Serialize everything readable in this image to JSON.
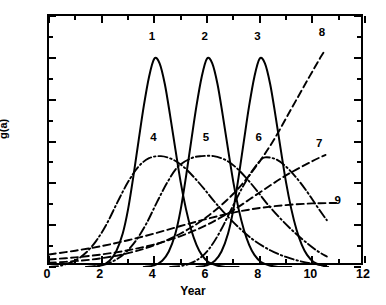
{
  "chart_data": {
    "type": "line",
    "title": "",
    "xlabel": "Year",
    "ylabel": "g(a)",
    "xlim": [
      0,
      12
    ],
    "ylim": [
      0.0,
      0.6
    ],
    "grid": false,
    "legend_position": "inline-annotations",
    "x_ticks": [
      "0",
      "2",
      "4",
      "6",
      "8",
      "10",
      "12"
    ],
    "x_tick_values": [
      0,
      2,
      4,
      6,
      8,
      10,
      12
    ],
    "x_minor_tick_values": [
      1,
      3,
      5,
      7,
      9,
      11
    ],
    "y_ticks": [
      "0.0",
      "0.1",
      "0.2",
      "0.3",
      "0.4",
      "0.5",
      "0.6"
    ],
    "y_tick_values": [
      0.0,
      0.1,
      0.2,
      0.3,
      0.4,
      0.5,
      0.6
    ],
    "y_minor_tick_values": [
      0.05,
      0.15,
      0.25,
      0.35,
      0.45,
      0.55
    ],
    "series": [
      {
        "name": "1",
        "label": "1",
        "style": "solid",
        "label_x": 4.0,
        "label_y": 0.545,
        "peak_x": 4.0,
        "peak_y": 0.5,
        "points": [
          [
            1.6,
            0.0
          ],
          [
            2.0,
            0.004
          ],
          [
            2.3,
            0.015
          ],
          [
            2.55,
            0.037
          ],
          [
            2.8,
            0.08
          ],
          [
            3.0,
            0.137
          ],
          [
            3.2,
            0.215
          ],
          [
            3.4,
            0.301
          ],
          [
            3.6,
            0.385
          ],
          [
            3.8,
            0.455
          ],
          [
            4.0,
            0.498
          ],
          [
            4.2,
            0.487
          ],
          [
            4.4,
            0.437
          ],
          [
            4.6,
            0.362
          ],
          [
            4.8,
            0.281
          ],
          [
            5.0,
            0.203
          ],
          [
            5.2,
            0.139
          ],
          [
            5.4,
            0.089
          ],
          [
            5.6,
            0.053
          ],
          [
            5.8,
            0.029
          ],
          [
            6.05,
            0.012
          ],
          [
            6.35,
            0.004
          ],
          [
            6.7,
            0.0
          ],
          [
            7.2,
            0.0
          ]
        ]
      },
      {
        "name": "2",
        "label": "2",
        "style": "solid",
        "label_x": 6.0,
        "label_y": 0.545,
        "peak_x": 6.0,
        "peak_y": 0.5,
        "points": [
          [
            3.6,
            0.0
          ],
          [
            4.0,
            0.004
          ],
          [
            4.3,
            0.015
          ],
          [
            4.55,
            0.037
          ],
          [
            4.8,
            0.08
          ],
          [
            5.0,
            0.137
          ],
          [
            5.2,
            0.215
          ],
          [
            5.4,
            0.301
          ],
          [
            5.6,
            0.385
          ],
          [
            5.8,
            0.455
          ],
          [
            6.0,
            0.498
          ],
          [
            6.2,
            0.487
          ],
          [
            6.4,
            0.437
          ],
          [
            6.6,
            0.362
          ],
          [
            6.8,
            0.281
          ],
          [
            7.0,
            0.203
          ],
          [
            7.2,
            0.139
          ],
          [
            7.4,
            0.089
          ],
          [
            7.6,
            0.053
          ],
          [
            7.8,
            0.029
          ],
          [
            8.05,
            0.012
          ],
          [
            8.35,
            0.004
          ],
          [
            8.7,
            0.0
          ],
          [
            9.2,
            0.0
          ]
        ]
      },
      {
        "name": "3",
        "label": "3",
        "style": "solid",
        "label_x": 8.0,
        "label_y": 0.545,
        "peak_x": 8.0,
        "peak_y": 0.5,
        "points": [
          [
            5.6,
            0.0
          ],
          [
            6.0,
            0.004
          ],
          [
            6.3,
            0.015
          ],
          [
            6.55,
            0.037
          ],
          [
            6.8,
            0.08
          ],
          [
            7.0,
            0.137
          ],
          [
            7.2,
            0.215
          ],
          [
            7.4,
            0.301
          ],
          [
            7.6,
            0.385
          ],
          [
            7.8,
            0.455
          ],
          [
            8.0,
            0.498
          ],
          [
            8.2,
            0.487
          ],
          [
            8.4,
            0.437
          ],
          [
            8.6,
            0.362
          ],
          [
            8.8,
            0.281
          ],
          [
            9.0,
            0.203
          ],
          [
            9.2,
            0.139
          ],
          [
            9.4,
            0.089
          ],
          [
            9.6,
            0.053
          ],
          [
            9.8,
            0.029
          ],
          [
            10.05,
            0.012
          ],
          [
            10.35,
            0.004
          ],
          [
            10.6,
            0.0
          ]
        ]
      },
      {
        "name": "4",
        "label": "4",
        "style": "dash-dot",
        "label_x": 4.05,
        "label_y": 0.303,
        "peak_x": 4.25,
        "peak_y": 0.265,
        "points": [
          [
            0.0,
            0.0
          ],
          [
            0.5,
            0.004
          ],
          [
            1.0,
            0.016
          ],
          [
            1.4,
            0.034
          ],
          [
            1.8,
            0.063
          ],
          [
            2.2,
            0.104
          ],
          [
            2.6,
            0.155
          ],
          [
            3.0,
            0.203
          ],
          [
            3.4,
            0.24
          ],
          [
            3.8,
            0.26
          ],
          [
            4.25,
            0.265
          ],
          [
            4.7,
            0.257
          ],
          [
            5.1,
            0.24
          ],
          [
            5.5,
            0.215
          ],
          [
            5.9,
            0.186
          ],
          [
            6.3,
            0.155
          ],
          [
            6.8,
            0.12
          ],
          [
            7.3,
            0.089
          ],
          [
            7.8,
            0.063
          ],
          [
            8.4,
            0.04
          ],
          [
            9.0,
            0.024
          ],
          [
            9.6,
            0.013
          ],
          [
            10.2,
            0.006
          ],
          [
            10.55,
            0.003
          ]
        ]
      },
      {
        "name": "5",
        "label": "5",
        "style": "dash-dot",
        "label_x": 6.05,
        "label_y": 0.303,
        "peak_x": 6.25,
        "peak_y": 0.265,
        "points": [
          [
            1.4,
            0.0
          ],
          [
            2.0,
            0.004
          ],
          [
            2.5,
            0.016
          ],
          [
            2.9,
            0.034
          ],
          [
            3.3,
            0.063
          ],
          [
            3.7,
            0.104
          ],
          [
            4.1,
            0.155
          ],
          [
            4.5,
            0.203
          ],
          [
            4.9,
            0.24
          ],
          [
            5.4,
            0.26
          ],
          [
            5.8,
            0.265
          ],
          [
            6.25,
            0.265
          ],
          [
            6.7,
            0.256
          ],
          [
            7.1,
            0.238
          ],
          [
            7.5,
            0.212
          ],
          [
            7.9,
            0.182
          ],
          [
            8.3,
            0.15
          ],
          [
            8.8,
            0.115
          ],
          [
            9.3,
            0.084
          ],
          [
            9.8,
            0.057
          ],
          [
            10.2,
            0.038
          ],
          [
            10.55,
            0.025
          ]
        ]
      },
      {
        "name": "6",
        "label": "6",
        "style": "dash-dot",
        "label_x": 8.05,
        "label_y": 0.303,
        "peak_x": 8.2,
        "peak_y": 0.262,
        "points": [
          [
            4.6,
            0.0
          ],
          [
            5.2,
            0.005
          ],
          [
            5.7,
            0.02
          ],
          [
            6.1,
            0.045
          ],
          [
            6.5,
            0.085
          ],
          [
            6.9,
            0.135
          ],
          [
            7.3,
            0.185
          ],
          [
            7.7,
            0.228
          ],
          [
            8.0,
            0.253
          ],
          [
            8.2,
            0.262
          ],
          [
            8.6,
            0.258
          ],
          [
            9.0,
            0.24
          ],
          [
            9.4,
            0.213
          ],
          [
            9.8,
            0.18
          ],
          [
            10.1,
            0.152
          ],
          [
            10.4,
            0.125
          ],
          [
            10.55,
            0.112
          ]
        ]
      },
      {
        "name": "7",
        "label": "7",
        "style": "dashed",
        "label_x": 10.35,
        "label_y": 0.29,
        "end_x": 10.5,
        "end_y": 0.268,
        "points": [
          [
            0.0,
            0.018
          ],
          [
            1.0,
            0.023
          ],
          [
            2.0,
            0.03
          ],
          [
            3.0,
            0.04
          ],
          [
            4.0,
            0.054
          ],
          [
            5.0,
            0.074
          ],
          [
            6.0,
            0.101
          ],
          [
            7.0,
            0.136
          ],
          [
            8.0,
            0.178
          ],
          [
            9.0,
            0.219
          ],
          [
            10.0,
            0.253
          ],
          [
            10.5,
            0.268
          ]
        ]
      },
      {
        "name": "8",
        "label": "8",
        "style": "dashed",
        "label_x": 10.45,
        "label_y": 0.555,
        "end_x": 10.5,
        "end_y": 0.52,
        "points": [
          [
            0.0,
            0.01
          ],
          [
            1.0,
            0.014
          ],
          [
            2.0,
            0.021
          ],
          [
            3.0,
            0.033
          ],
          [
            4.0,
            0.052
          ],
          [
            5.0,
            0.08
          ],
          [
            6.0,
            0.12
          ],
          [
            7.0,
            0.175
          ],
          [
            7.8,
            0.235
          ],
          [
            8.5,
            0.3
          ],
          [
            9.2,
            0.378
          ],
          [
            9.8,
            0.445
          ],
          [
            10.3,
            0.5
          ],
          [
            10.5,
            0.52
          ]
        ]
      },
      {
        "name": "9",
        "label": "9",
        "style": "dashed",
        "label_x": 11.05,
        "label_y": 0.152,
        "end_x": 10.5,
        "end_y": 0.152,
        "points": [
          [
            0.0,
            0.03
          ],
          [
            1.0,
            0.039
          ],
          [
            2.0,
            0.05
          ],
          [
            3.0,
            0.064
          ],
          [
            4.0,
            0.08
          ],
          [
            5.0,
            0.098
          ],
          [
            6.0,
            0.115
          ],
          [
            7.0,
            0.13
          ],
          [
            8.0,
            0.141
          ],
          [
            9.0,
            0.148
          ],
          [
            10.0,
            0.152
          ],
          [
            10.9,
            0.153
          ]
        ]
      }
    ]
  },
  "axes": {
    "x_title": "Year",
    "y_title": "g(a)"
  },
  "colors": {
    "ink": "#000000",
    "background": "#ffffff"
  }
}
